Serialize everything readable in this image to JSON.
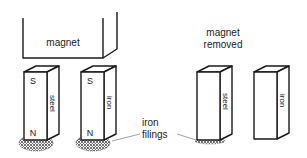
{
  "diagram": {
    "magnet_label": "magnet",
    "removed_label_line1": "magnet",
    "removed_label_line2": "removed",
    "filings_label_line1": "iron",
    "filings_label_line2": "filings",
    "bars": [
      {
        "material": "steel",
        "top_pole": "S",
        "bottom_pole": "N",
        "filings": "heavy",
        "state": "with-magnet"
      },
      {
        "material": "iron",
        "top_pole": "S",
        "bottom_pole": "N",
        "filings": "heavy",
        "state": "with-magnet"
      },
      {
        "material": "steel",
        "top_pole": "",
        "bottom_pole": "",
        "filings": "light",
        "state": "magnet-removed"
      },
      {
        "material": "iron",
        "top_pole": "",
        "bottom_pole": "",
        "filings": "none",
        "state": "magnet-removed"
      }
    ]
  },
  "colors": {
    "line": "#1a1a1a",
    "text": "#222222",
    "filings": "#333333",
    "leader": "#888888"
  }
}
